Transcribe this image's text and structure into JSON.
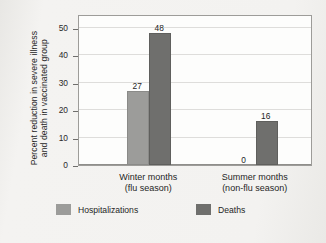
{
  "chart_data": {
    "type": "bar",
    "title": "",
    "xlabel": "",
    "ylabel": "Percent reduction in severe illness and death in vaccinated group",
    "ylabel_line1": "Percent reduction in severe illness",
    "ylabel_line2": "and death in vaccinated group",
    "ylim": [
      0,
      55
    ],
    "yticks": [
      0,
      10,
      20,
      30,
      40,
      50
    ],
    "ytick_labels": [
      "0",
      "10",
      "20",
      "30",
      "40",
      "50"
    ],
    "grid": true,
    "legend_position": "bottom",
    "categories": [
      "Winter months (flu season)",
      "Summer months (non-flu season)"
    ],
    "category_labels": [
      {
        "line1": "Winter months",
        "line2": "(flu season)"
      },
      {
        "line1": "Summer months",
        "line2": "(non-flu season)"
      }
    ],
    "series": [
      {
        "name": "Hospitalizations",
        "color": "#9c9c9a",
        "values": [
          27,
          0
        ],
        "value_labels": [
          "27",
          "0"
        ]
      },
      {
        "name": "Deaths",
        "color": "#6f6f6d",
        "values": [
          48,
          16
        ],
        "value_labels": [
          "48",
          "16"
        ]
      }
    ]
  },
  "legend": {
    "items": [
      {
        "label": "Hospitalizations",
        "color": "#9c9c9a"
      },
      {
        "label": "Deaths",
        "color": "#6f6f6d"
      }
    ]
  }
}
